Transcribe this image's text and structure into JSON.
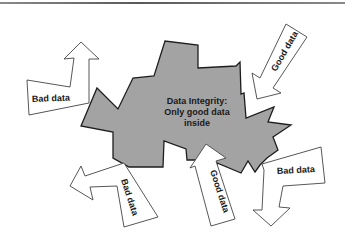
{
  "diagram": {
    "center": {
      "line1": "Data Integrity:",
      "line2": "Only good data",
      "line3": "inside"
    },
    "arrows": [
      {
        "id": "bad-top-left",
        "label": "Bad data",
        "direction": "outward"
      },
      {
        "id": "good-top-right",
        "label": "Good data",
        "direction": "inward"
      },
      {
        "id": "bad-bottom-left",
        "label": "Bad data",
        "direction": "outward"
      },
      {
        "id": "good-bottom-center",
        "label": "Good data",
        "direction": "inward"
      },
      {
        "id": "bad-bottom-right",
        "label": "Bad data",
        "direction": "outward"
      }
    ],
    "colors": {
      "blob_fill": "#a3a3a3",
      "blob_stroke": "#1e1e1e",
      "arrow_fill": "#ffffff",
      "arrow_stroke": "#444444"
    }
  }
}
